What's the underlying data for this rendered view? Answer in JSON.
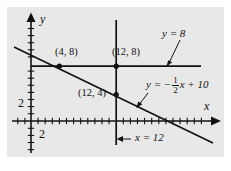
{
  "figure": {
    "background_color": "#ffffff",
    "panel_color": "#e8e8e8",
    "ink_color": "#121212",
    "width": 231,
    "height": 171
  },
  "axes": {
    "x_axis_label": "x",
    "y_axis_label": "y",
    "x_tick_label": "2",
    "y_tick_label": "2",
    "origin_px": [
      31,
      121
    ],
    "unit_px": 7.1,
    "x_range": [
      -2.2,
      26
    ],
    "y_range": [
      -5,
      14
    ],
    "tick_interval": 1,
    "grid": false
  },
  "lines": [
    {
      "name": "horizontal-line",
      "label": "y = 8",
      "equation_text": "y = 8",
      "kind": "horizontal",
      "y_value": 8,
      "x_from": 0,
      "x_to": 24
    },
    {
      "name": "vertical-line",
      "label": "x = 12",
      "equation_text": "x = 12",
      "kind": "vertical",
      "x_value": 12,
      "y_from": -3.4,
      "y_to": 14.2
    },
    {
      "name": "sloped-line",
      "label_prefix": "y = −",
      "label_numerator": "1",
      "label_denominator": "2",
      "label_suffix": "x + 10",
      "equation_text": "y = -1/2 x + 10",
      "kind": "linear",
      "slope": -0.5,
      "intercept": 10,
      "x_from": -2.2,
      "x_to": 25.5
    }
  ],
  "points": [
    {
      "name": "point-4-8",
      "label": "(4, 8)",
      "x": 4,
      "y": 8
    },
    {
      "name": "point-12-8",
      "label": "(12, 8)",
      "x": 12,
      "y": 8
    },
    {
      "name": "point-12-4",
      "label": "(12, 4)",
      "x": 12,
      "y": 4
    }
  ],
  "annotations": {
    "y8_callout": "y = 8",
    "x12_callout": "x = 12"
  }
}
